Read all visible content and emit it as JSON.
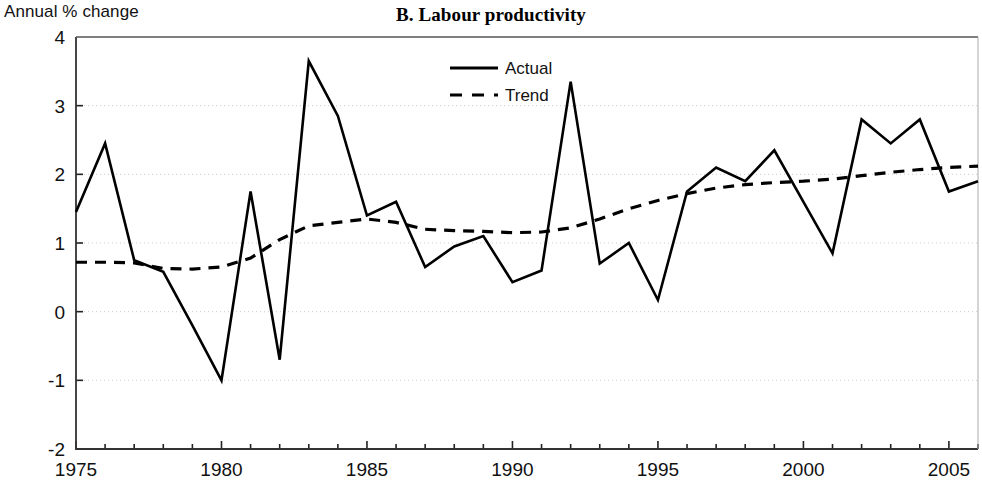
{
  "chart_data": {
    "type": "line",
    "title": "B. Labour productivity",
    "ylabel": "Annual % change",
    "xlabel": "",
    "ylim": [
      -2,
      4
    ],
    "xlim": [
      1975,
      2006
    ],
    "yticks": [
      -2,
      -1,
      0,
      1,
      2,
      3,
      4
    ],
    "ytick_labels": [
      "-2",
      "-1",
      "0",
      "1",
      "2",
      "3",
      "4"
    ],
    "xticks": [
      1975,
      1980,
      1985,
      1990,
      1995,
      2000,
      2005
    ],
    "xtick_labels": [
      "1975",
      "1980",
      "1985",
      "1990",
      "1995",
      "2000",
      "2005"
    ],
    "x_minor_tick_interval": 1,
    "grid": "horizontal-dotted",
    "legend_position": "top-center",
    "x": [
      1975,
      1976,
      1977,
      1978,
      1979,
      1980,
      1981,
      1982,
      1983,
      1984,
      1985,
      1986,
      1987,
      1988,
      1989,
      1990,
      1991,
      1992,
      1993,
      1994,
      1995,
      1996,
      1997,
      1998,
      1999,
      2000,
      2001,
      2002,
      2003,
      2004,
      2005,
      2006
    ],
    "series": [
      {
        "name": "Actual",
        "style": "solid",
        "color": "#000000",
        "values": [
          1.45,
          2.45,
          0.75,
          0.58,
          -0.2,
          -1.0,
          1.75,
          -0.7,
          3.65,
          2.85,
          1.4,
          1.6,
          0.65,
          0.95,
          1.1,
          0.43,
          0.6,
          3.35,
          0.7,
          1.0,
          0.17,
          1.75,
          2.1,
          1.9,
          2.35,
          1.6,
          0.85,
          2.8,
          2.45,
          2.8,
          1.75,
          1.9
        ]
      },
      {
        "name": "Trend",
        "style": "dashed",
        "color": "#000000",
        "values": [
          0.72,
          0.72,
          0.71,
          0.63,
          0.62,
          0.65,
          0.78,
          1.05,
          1.25,
          1.3,
          1.35,
          1.3,
          1.2,
          1.18,
          1.17,
          1.15,
          1.16,
          1.22,
          1.35,
          1.5,
          1.62,
          1.72,
          1.8,
          1.85,
          1.88,
          1.9,
          1.93,
          1.98,
          2.03,
          2.07,
          2.1,
          2.12
        ]
      }
    ]
  },
  "legend": {
    "items": [
      {
        "label": "Actual",
        "style": "solid"
      },
      {
        "label": "Trend",
        "style": "dashed"
      }
    ]
  }
}
